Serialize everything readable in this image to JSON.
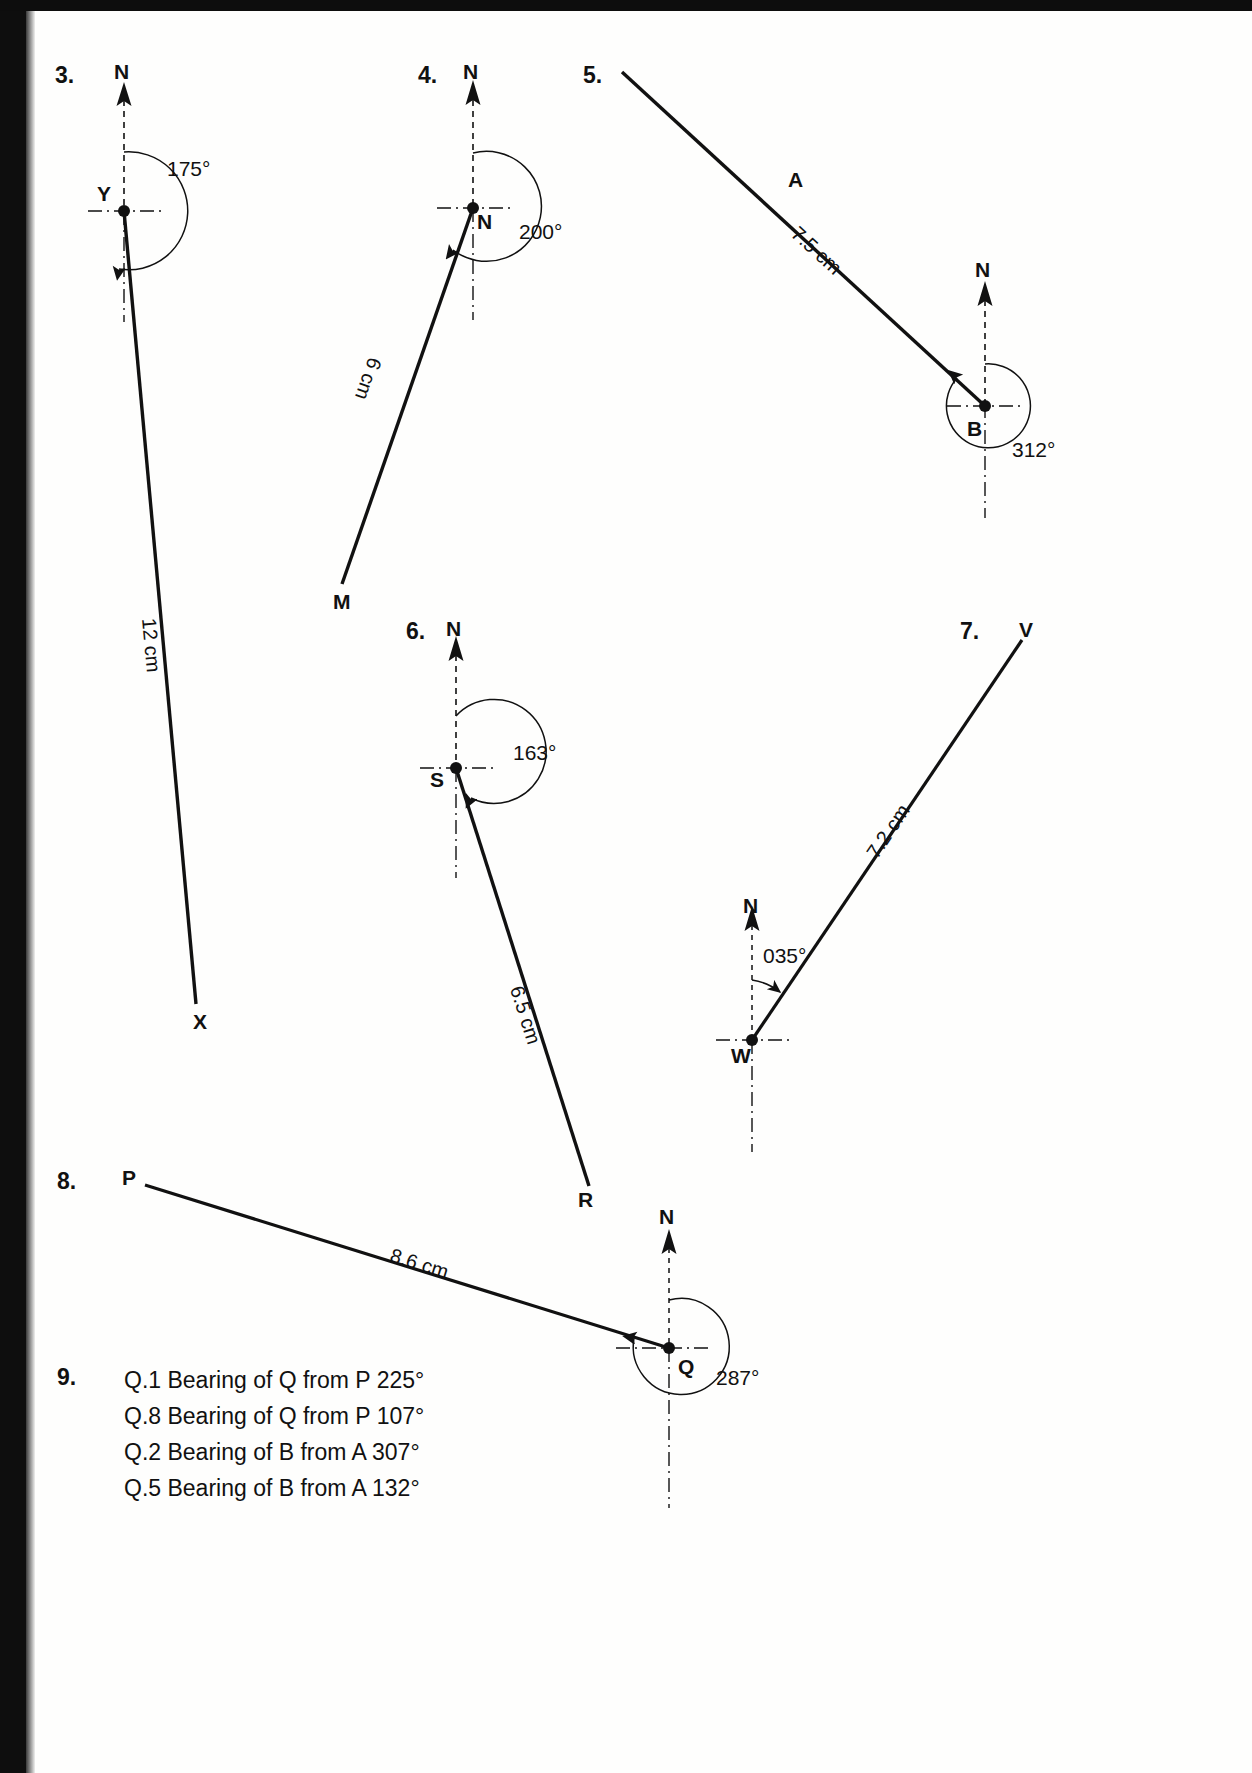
{
  "page": {
    "width": 1252,
    "height": 1773,
    "background": "#fefefd",
    "ink": "#111111"
  },
  "questions": [
    {
      "number": "3.",
      "north_label": "N",
      "origin_label": "Y",
      "end_label": "X",
      "angle": "175°",
      "length": "12 cm"
    },
    {
      "number": "4.",
      "north_label": "N",
      "origin_label": "N",
      "end_label": "M",
      "angle": "200°",
      "length": "6 cm"
    },
    {
      "number": "5.",
      "north_label": "N",
      "origin_label": "B",
      "end_label": "A",
      "angle": "312°",
      "length": "7.5 cm"
    },
    {
      "number": "6.",
      "north_label": "N",
      "origin_label": "S",
      "end_label": "R",
      "angle": "163°",
      "length": "6.5 cm"
    },
    {
      "number": "7.",
      "north_label": "N",
      "origin_label": "W",
      "end_label": "V",
      "angle": "035°",
      "length": "7.2 cm"
    },
    {
      "number": "8.",
      "north_label": "N",
      "origin_label": "Q",
      "end_label": "P",
      "angle": "287°",
      "length": "8.6 cm"
    }
  ],
  "answers": {
    "number": "9.",
    "lines": [
      "Q.1 Bearing of Q from P 225°",
      "Q.8 Bearing of Q from P 107°",
      "Q.2 Bearing of B from A 307°",
      "Q.5 Bearing of B from A 132°"
    ]
  }
}
